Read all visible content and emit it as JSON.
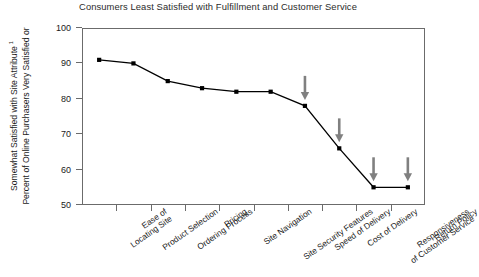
{
  "chart_data": {
    "type": "line",
    "title": "Consumers Least Satisfied with Fulfillment and Customer Service",
    "xlabel": "",
    "ylabel_line1": "Percent of Online Purchasers Very Satisfied or",
    "ylabel_line2": "Somewhat Satisfied with Site Attribute",
    "ylabel_footnote_marker": "1",
    "ylim": [
      50,
      100
    ],
    "yticks": [
      50,
      60,
      70,
      80,
      90,
      100
    ],
    "grid": false,
    "legend": "none",
    "categories": [
      "Ease of\nLocating Site",
      "Product Selection",
      "Ordering Process",
      "Pricing",
      "Site Navigation",
      "Site Security Features",
      "Speed of Delivery",
      "Cost of Delivery",
      "Responsiveness\nof Customer Service",
      "Return Policy"
    ],
    "category_lines": [
      [
        "Ease of",
        "Locating Site"
      ],
      [
        "Product Selection",
        ""
      ],
      [
        "Ordering Process",
        ""
      ],
      [
        "Pricing",
        ""
      ],
      [
        "Site Navigation",
        ""
      ],
      [
        "Site Security Features",
        ""
      ],
      [
        "Speed of Delivery",
        ""
      ],
      [
        "Cost of Delivery",
        ""
      ],
      [
        "Responsiveness",
        "of Customer Service"
      ],
      [
        "Return Policy",
        ""
      ]
    ],
    "values": [
      91,
      90,
      85,
      83,
      82,
      82,
      78,
      66,
      55,
      55
    ],
    "annotations": [
      {
        "type": "arrow-down",
        "target_category": "Speed of Delivery",
        "target_value": 78
      },
      {
        "type": "arrow-down",
        "target_category": "Cost of Delivery",
        "target_value": 66
      },
      {
        "type": "arrow-down",
        "target_category": "Responsiveness of Customer Service",
        "target_value": 55
      },
      {
        "type": "arrow-down",
        "target_category": "Return Policy",
        "target_value": 55
      }
    ],
    "colors": {
      "line": "#000000",
      "marker": "#000000",
      "arrow": "#808080",
      "frame": "#6b6b6b",
      "text": "#1a1a1a",
      "title": "#2b2b2b",
      "background": "#ffffff"
    }
  }
}
